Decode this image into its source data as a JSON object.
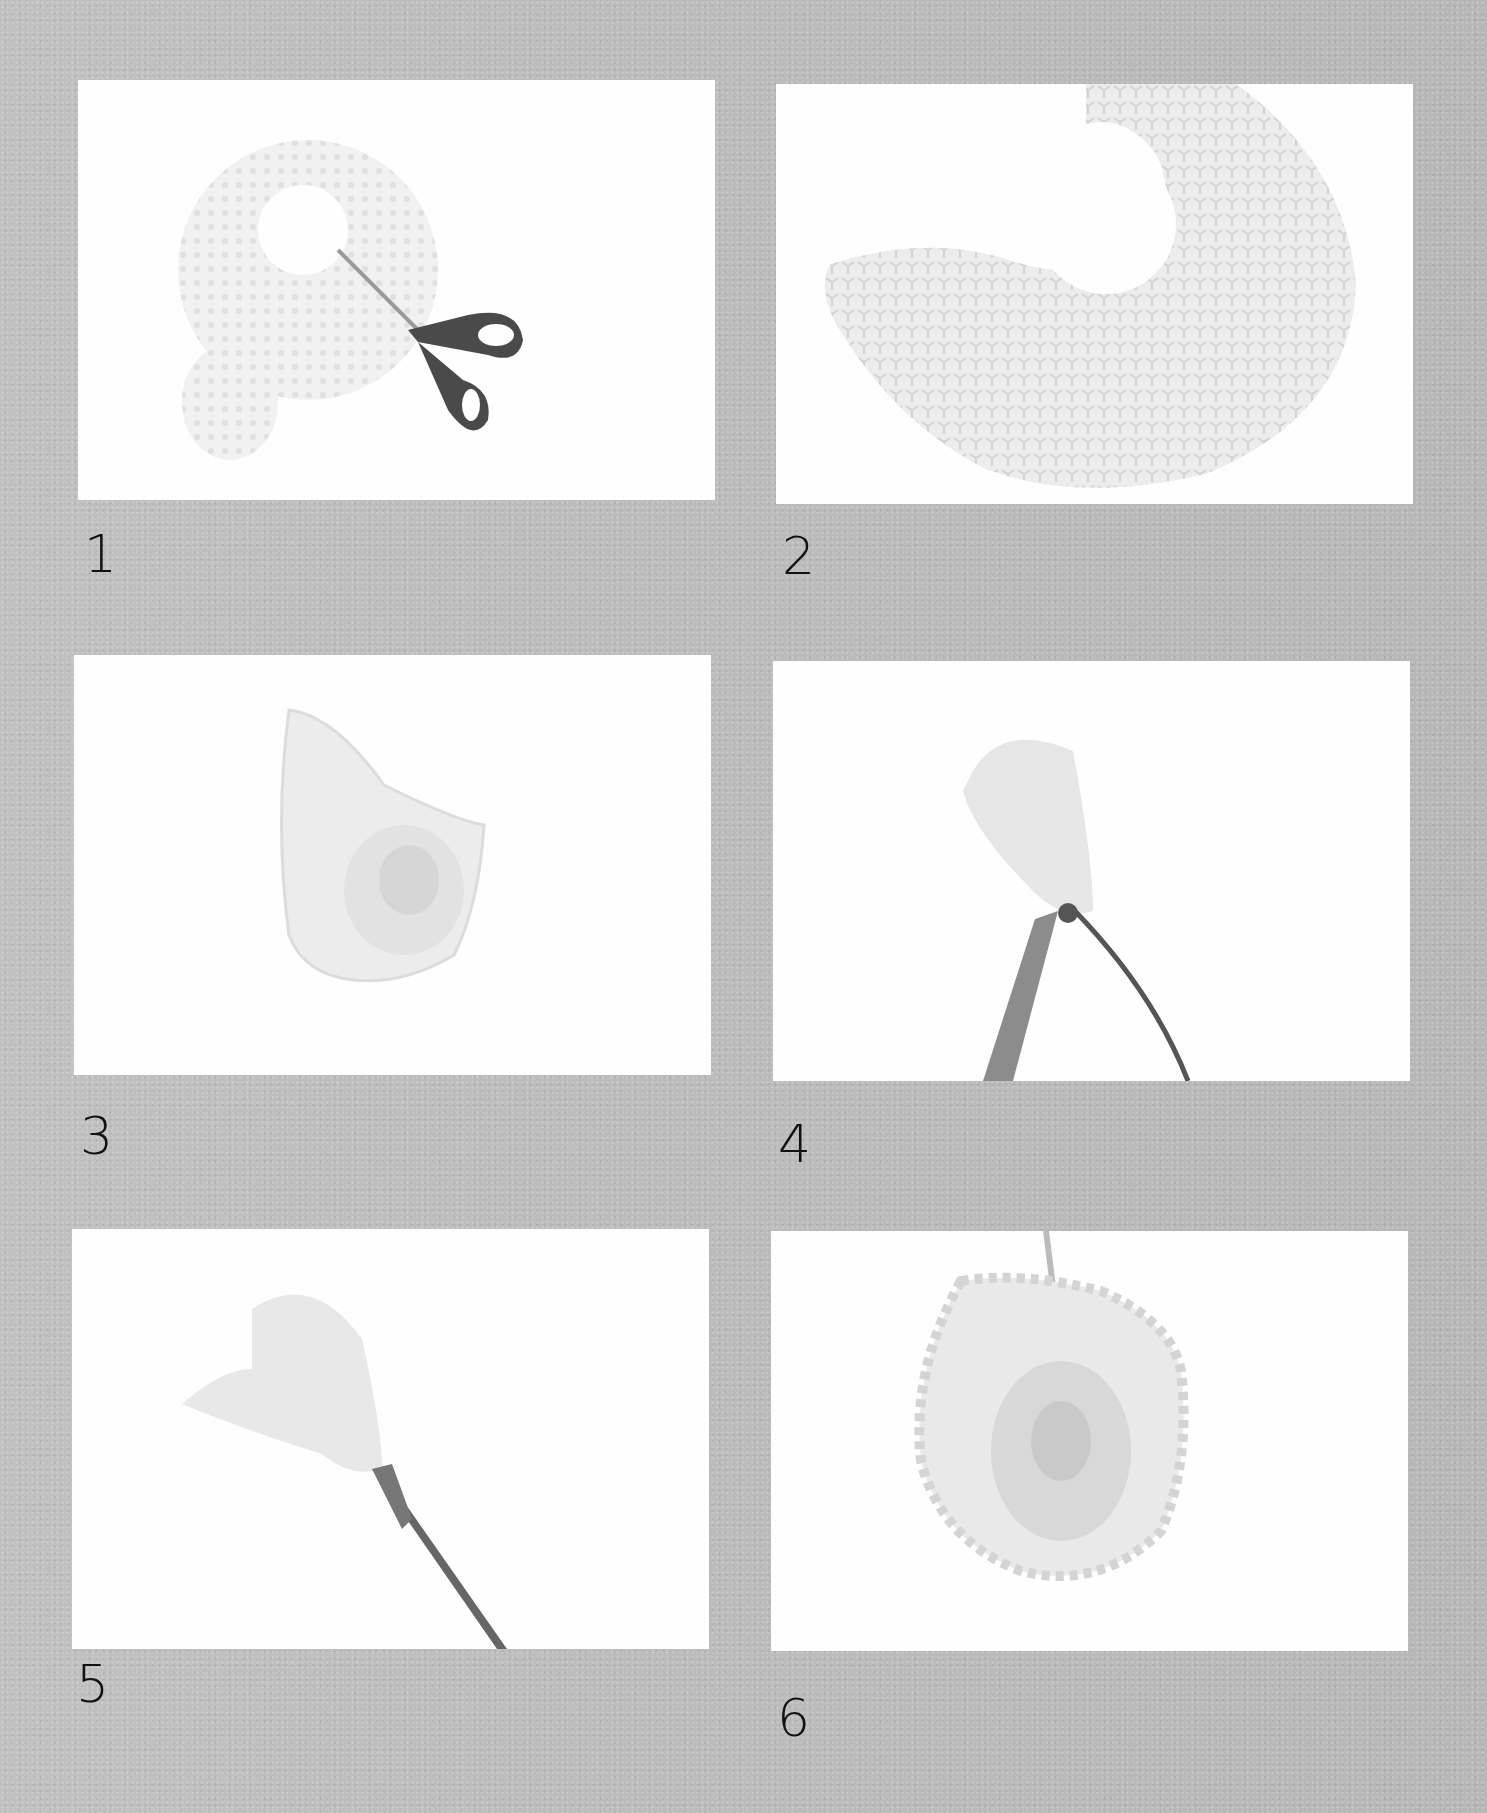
{
  "page": {
    "background_color": "#bdbdbd",
    "panel_color": "#fefefe"
  },
  "steps": [
    {
      "number": "1",
      "description": "Cut a circle from the doily center and slit the ring with scissors"
    },
    {
      "number": "2",
      "description": "Doily ring opened into a curved strip"
    },
    {
      "number": "3",
      "description": "Strip rolled into a rose-shaped cone"
    },
    {
      "number": "4",
      "description": "Base tied with wire and floral tape"
    },
    {
      "number": "5",
      "description": "Stem wrapped with tape"
    },
    {
      "number": "6",
      "description": "Finished doily rose, petals opened"
    }
  ]
}
